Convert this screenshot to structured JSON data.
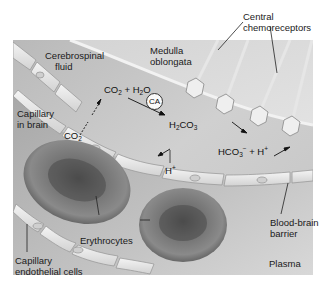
{
  "figure": {
    "background": "#ffffff",
    "panel_colors": {
      "csf": "#c9c9c9",
      "medulla": "#d6d6d6",
      "plasma": "#b8b8b8",
      "endothelium": "#e6e6e6",
      "erythrocyte": "#6a6a6a"
    }
  },
  "labels": {
    "central_chemoreceptors": [
      "Central",
      "chemoreceptors"
    ],
    "medulla_oblongata": [
      "Medulla",
      "oblongata"
    ],
    "cerebrospinal_fluid": [
      "Cerebrospinal",
      "fluid"
    ],
    "capillary_in_brain": [
      "Capillary",
      "in brain"
    ],
    "erythrocytes": "Erythrocytes",
    "blood_brain_barrier": [
      "Blood-brain",
      "barrier"
    ],
    "capillary_endothelial_cells": [
      "Capillary",
      "endothelial cells"
    ],
    "plasma": "Plasma"
  },
  "chemistry": {
    "co2_blood": {
      "base": "CO",
      "sub": "2"
    },
    "co2_h2o": {
      "a": "CO",
      "a_sub": "2",
      "plus": " + H",
      "b_sub": "2",
      "b": "O"
    },
    "enzyme": "CA",
    "h2co3": {
      "a": "H",
      "a_sub": "2",
      "b": "CO",
      "b_sub": "3"
    },
    "hco3_h": {
      "a": "HCO",
      "a_sub": "3",
      "a_sup": "−",
      "plus": " + H",
      "b_sup": "+"
    },
    "h_plus": {
      "a": "H",
      "sup": "+"
    }
  }
}
